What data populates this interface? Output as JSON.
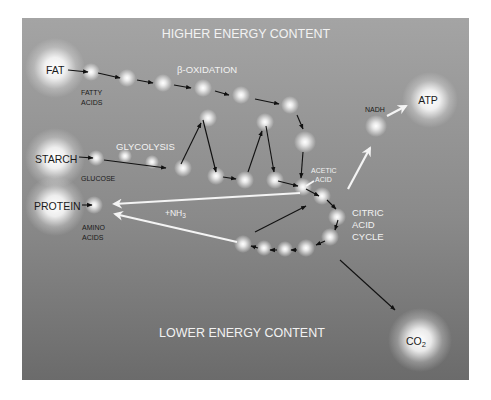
{
  "diagram": {
    "title_top": "HIGHER ENERGY CONTENT",
    "title_bottom": "LOWER ENERGY CONTENT",
    "colors": {
      "panel_top": "#a3a3a3",
      "panel_bottom": "#6c6c6c",
      "glow": "#ffffff",
      "dark_arrow": "#111111",
      "light_arrow": "#f4f4f4",
      "dark_text": "#1a1a1a",
      "light_text": "#f2f2f2"
    },
    "nodes": {
      "fat": "FAT",
      "starch": "STARCH",
      "protein": "PROTEIN",
      "atp": "ATP",
      "co2_main": "CO",
      "co2_sub": "2",
      "nadh": "NADH"
    },
    "intermediates": {
      "fatty_acids_1": "FATTY",
      "fatty_acids_2": "ACIDS",
      "glucose": "GLUCOSE",
      "amino_acids_1": "AMINO",
      "amino_acids_2": "ACIDS",
      "acetic_acid_1": "ACETIC",
      "acetic_acid_2": "ACID"
    },
    "processes": {
      "beta_oxidation": "β-OXIDATION",
      "glycolysis": "GLYCOLYSIS",
      "nh3_prefix": "+NH",
      "nh3_sub": "3",
      "citric_1": "CITRIC",
      "citric_2": "ACID",
      "citric_3": "CYCLE"
    }
  }
}
